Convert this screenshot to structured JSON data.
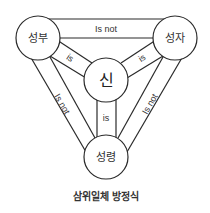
{
  "diagram": {
    "title": "삼위일체 방정식",
    "nodes": {
      "father": "성부",
      "son": "성자",
      "god": "신",
      "spirit": "성령"
    },
    "edges": {
      "father_son": "Is not",
      "father_god": "is",
      "son_god": "is",
      "god_spirit": "is",
      "father_spirit": "Is not",
      "son_spirit": "Is not"
    },
    "colors": {
      "stroke": "#2a2a2a",
      "text": "#333333",
      "background": "#ffffff"
    }
  }
}
